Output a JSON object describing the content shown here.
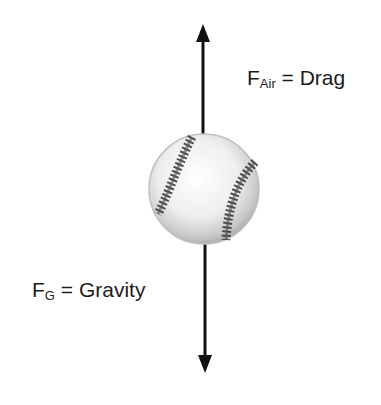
{
  "diagram": {
    "forces": [
      {
        "id": "drag",
        "symbol": "F",
        "subscript": "Air",
        "equals": "=",
        "name": "Drag",
        "direction": "up"
      },
      {
        "id": "gravity",
        "symbol": "F",
        "subscript": "G",
        "equals": "=",
        "name": "Gravity",
        "direction": "down"
      }
    ],
    "colors": {
      "arrow": "#111111",
      "ball_fill": "#f4f4f4",
      "ball_shadow": "#bdbdbd",
      "stitches": "#3a3a3a",
      "text": "#1c1c1c"
    }
  }
}
